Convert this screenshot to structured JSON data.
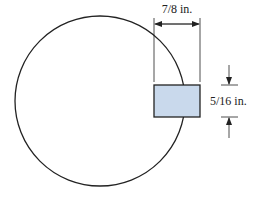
{
  "figure": {
    "width_label": "7/8 in.",
    "height_label": "5/16 in.",
    "shapes": {
      "circle": "large circle",
      "rectangle": "blue rectangular cross-section"
    },
    "colors": {
      "stroke": "#222222",
      "rect_fill": "#c9d9ec"
    }
  }
}
